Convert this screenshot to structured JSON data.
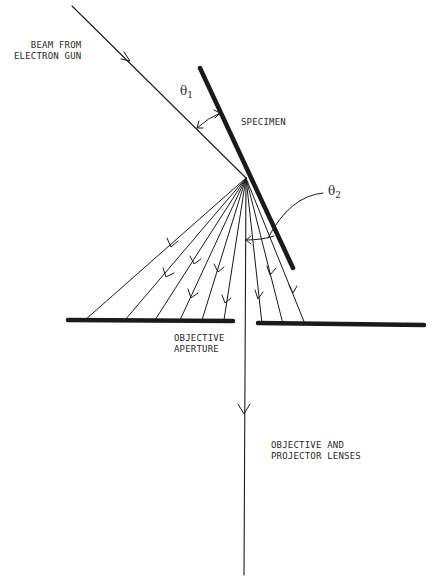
{
  "diagram": {
    "labels": {
      "beam_source": "BEAM FROM\nELECTRON GUN",
      "specimen": "SPECIMEN",
      "aperture": "OBJECTIVE\nAPERTURE",
      "lenses": "OBJECTIVE AND\nPROJECTOR LENSES",
      "theta1_symbol": "θ",
      "theta1_sub": "1",
      "theta2_symbol": "θ",
      "theta2_sub": "2"
    },
    "colors": {
      "ink": "#1a1a1a",
      "background": "#ffffff"
    },
    "geometry": {
      "incident_beam": {
        "from": [
          72,
          6
        ],
        "to": [
          246,
          178
        ]
      },
      "specimen": {
        "from": [
          200,
          68
        ],
        "to": [
          293,
          268
        ]
      },
      "scatter_origin": [
        246,
        178
      ],
      "left_rays_end_x": [
        85,
        125,
        155,
        180,
        202,
        224
      ],
      "right_rays_end_x": [
        262,
        283,
        305
      ],
      "central_ray_end_y": 575,
      "left_bar": {
        "x1": 68,
        "x2": 233,
        "y": 320
      },
      "right_bar": {
        "x1": 258,
        "x2": 424,
        "y": 324
      }
    }
  }
}
